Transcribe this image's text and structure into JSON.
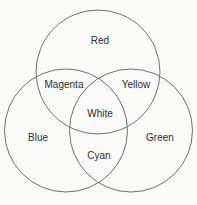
{
  "figure": {
    "type": "venn-diagram",
    "colors": {
      "background": "#fafaf8",
      "circle_stroke": "#707070",
      "label_text": "#2e2e2e"
    },
    "sets": {
      "top": "Red",
      "left": "Blue",
      "right": "Green"
    },
    "overlaps": {
      "top_left": "Magenta",
      "top_right": "Yellow",
      "bottom": "Cyan",
      "center": "White"
    }
  }
}
